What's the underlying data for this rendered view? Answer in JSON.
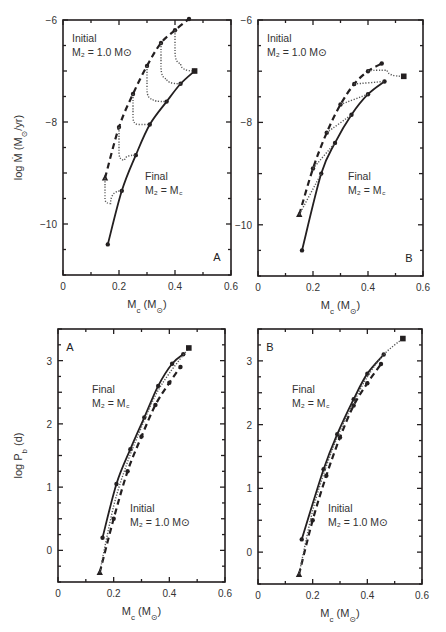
{
  "chart_data": [
    {
      "type": "line",
      "panel": "A",
      "position": "top-left",
      "xlabel": "M_c (M_⊙)",
      "ylabel": "log Ṁ (M_⊙/yr)",
      "xlim": [
        0,
        0.6
      ],
      "ylim": [
        -11,
        -6
      ],
      "xticks": [
        0,
        0.2,
        0.4,
        0.6
      ],
      "xtick_labels": [
        "0",
        "0.2",
        "0.4",
        "0.6"
      ],
      "yticks": [
        -10,
        -8,
        -6
      ],
      "ytick_labels": [
        "−10",
        "−8",
        "−6"
      ],
      "annotations": [
        {
          "text1": "Initial",
          "text2": "M₂ = 1.0 M⊙",
          "at": "top-left"
        },
        {
          "text1": "Final",
          "text2": "M₂ = M꜀",
          "at": "center-right"
        }
      ],
      "series": [
        {
          "name": "Final M2 = Mc",
          "style": "solid",
          "x": [
            0.16,
            0.21,
            0.26,
            0.31,
            0.37,
            0.42,
            0.47
          ],
          "y": [
            -10.4,
            -9.35,
            -8.65,
            -8.05,
            -7.6,
            -7.25,
            -7.0
          ]
        },
        {
          "name": "Initial M2 = 1.0 Msun",
          "style": "dashed",
          "x": [
            0.15,
            0.2,
            0.25,
            0.3,
            0.35,
            0.4,
            0.45
          ],
          "y": [
            -9.1,
            -8.1,
            -7.45,
            -6.9,
            -6.45,
            -6.2,
            -5.98
          ]
        },
        {
          "name": "track 1",
          "style": "dotted",
          "x": [
            0.15,
            0.15,
            0.17,
            0.21
          ],
          "y": [
            -9.1,
            -9.5,
            -9.6,
            -9.35
          ]
        },
        {
          "name": "track 2",
          "style": "dotted",
          "x": [
            0.2,
            0.2,
            0.22,
            0.26
          ],
          "y": [
            -8.1,
            -8.6,
            -8.75,
            -8.65
          ]
        },
        {
          "name": "track 3",
          "style": "dotted",
          "x": [
            0.25,
            0.25,
            0.27,
            0.31
          ],
          "y": [
            -7.45,
            -7.9,
            -8.05,
            -8.05
          ]
        },
        {
          "name": "track 4",
          "style": "dotted",
          "x": [
            0.3,
            0.3,
            0.32,
            0.37
          ],
          "y": [
            -6.9,
            -7.35,
            -7.55,
            -7.6
          ]
        },
        {
          "name": "track 5",
          "style": "dotted",
          "x": [
            0.35,
            0.35,
            0.37,
            0.42
          ],
          "y": [
            -6.45,
            -6.9,
            -7.15,
            -7.25
          ]
        },
        {
          "name": "track 6",
          "style": "dotted",
          "x": [
            0.4,
            0.4,
            0.42,
            0.47
          ],
          "y": [
            -6.2,
            -6.6,
            -6.85,
            -7.0
          ]
        }
      ],
      "end_marker": {
        "x": 0.47,
        "y": -7.0
      }
    },
    {
      "type": "line",
      "panel": "B",
      "position": "top-right",
      "xlabel": "M_c (M_⊙)",
      "xlim": [
        0,
        0.6
      ],
      "ylim": [
        -11,
        -6
      ],
      "xticks": [
        0,
        0.2,
        0.4,
        0.6
      ],
      "xtick_labels": [
        "0",
        "0.2",
        "0.4",
        "0.6"
      ],
      "yticks": [
        -10,
        -8,
        -6
      ],
      "ytick_labels": [
        "−10",
        "−8",
        "−6"
      ],
      "annotations": [
        {
          "text1": "Initial",
          "text2": "M₂ = 1.0 M⊙",
          "at": "top-left"
        },
        {
          "text1": "Final",
          "text2": "M₂ = M꜀",
          "at": "center-right"
        }
      ],
      "series": [
        {
          "name": "Final M2 = Mc",
          "style": "solid",
          "x": [
            0.16,
            0.23,
            0.28,
            0.34,
            0.4,
            0.46
          ],
          "y": [
            -10.5,
            -9.0,
            -8.4,
            -7.85,
            -7.45,
            -7.2
          ]
        },
        {
          "name": "Initial M2 = 1.0 Msun",
          "style": "dashed",
          "x": [
            0.15,
            0.2,
            0.25,
            0.3,
            0.35,
            0.4,
            0.45
          ],
          "y": [
            -9.8,
            -8.9,
            -8.2,
            -7.65,
            -7.25,
            -7.0,
            -6.85
          ]
        },
        {
          "name": "track 1",
          "style": "dotted",
          "x": [
            0.15,
            0.23
          ],
          "y": [
            -9.8,
            -9.0
          ]
        },
        {
          "name": "track 2",
          "style": "dotted",
          "x": [
            0.2,
            0.28
          ],
          "y": [
            -8.9,
            -8.4
          ]
        },
        {
          "name": "track 3",
          "style": "dotted",
          "x": [
            0.25,
            0.34
          ],
          "y": [
            -8.2,
            -7.85
          ]
        },
        {
          "name": "track 4",
          "style": "dotted",
          "x": [
            0.3,
            0.4
          ],
          "y": [
            -7.65,
            -7.45
          ]
        },
        {
          "name": "track 5",
          "style": "dotted",
          "x": [
            0.35,
            0.46
          ],
          "y": [
            -7.25,
            -7.2
          ]
        },
        {
          "name": "track 6",
          "style": "dotted",
          "x": [
            0.4,
            0.47,
            0.53
          ],
          "y": [
            -7.0,
            -6.98,
            -7.1
          ]
        }
      ],
      "end_marker": {
        "x": 0.53,
        "y": -7.1
      }
    },
    {
      "type": "line",
      "panel": "A",
      "position": "bottom-left",
      "xlabel": "M_c (M_⊙)",
      "ylabel": "log P_b (d)",
      "xlim": [
        0,
        0.6
      ],
      "ylim": [
        -0.5,
        3.5
      ],
      "xticks": [
        0,
        0.2,
        0.4,
        0.6
      ],
      "xtick_labels": [
        "0",
        "0.2",
        "0.4",
        "0.6"
      ],
      "yticks": [
        0,
        1,
        2,
        3
      ],
      "ytick_labels": [
        "0",
        "1",
        "2",
        "3"
      ],
      "annotations": [
        {
          "text1": "Final",
          "text2": "M₂ = M꜀",
          "at": "upper-middle"
        },
        {
          "text1": "Initial",
          "text2": "M₂ = 1.0 M⊙",
          "at": "lower-right"
        }
      ],
      "series": [
        {
          "name": "Final M2 = Mc",
          "style": "solid",
          "x": [
            0.16,
            0.21,
            0.26,
            0.31,
            0.36,
            0.41,
            0.45
          ],
          "y": [
            0.2,
            1.05,
            1.6,
            2.1,
            2.6,
            2.95,
            3.1
          ]
        },
        {
          "name": "Initial M2 = 1.0 Msun",
          "style": "dashed",
          "x": [
            0.15,
            0.2,
            0.25,
            0.3,
            0.35,
            0.4,
            0.44
          ],
          "y": [
            -0.35,
            0.5,
            1.25,
            1.8,
            2.3,
            2.65,
            2.9
          ]
        },
        {
          "name": "tracks",
          "style": "dotted",
          "x": [
            0.15,
            0.2,
            0.25,
            0.3,
            0.35,
            0.4,
            0.47
          ],
          "y": [
            -0.35,
            0.7,
            1.4,
            1.95,
            2.45,
            2.8,
            3.2
          ]
        }
      ],
      "end_marker": {
        "x": 0.47,
        "y": 3.2
      }
    },
    {
      "type": "line",
      "panel": "B",
      "position": "bottom-right",
      "xlabel": "M_c (M_⊙)",
      "xlim": [
        0,
        0.6
      ],
      "ylim": [
        -0.5,
        3.5
      ],
      "xticks": [
        0,
        0.2,
        0.4,
        0.6
      ],
      "xtick_labels": [
        "0",
        "0.2",
        "0.4",
        "0.6"
      ],
      "yticks": [
        0,
        1,
        2,
        3
      ],
      "ytick_labels": [
        "0",
        "1",
        "2",
        "3"
      ],
      "annotations": [
        {
          "text1": "Final",
          "text2": "M₂ = M꜀",
          "at": "upper-middle"
        },
        {
          "text1": "Initial",
          "text2": "M₂ = 1.0 M⊙",
          "at": "lower-right"
        }
      ],
      "series": [
        {
          "name": "Final M2 = Mc",
          "style": "solid",
          "x": [
            0.16,
            0.24,
            0.29,
            0.35,
            0.4,
            0.46
          ],
          "y": [
            0.2,
            1.3,
            1.85,
            2.4,
            2.8,
            3.1
          ]
        },
        {
          "name": "Initial M2 = 1.0 Msun",
          "style": "dashed",
          "x": [
            0.15,
            0.2,
            0.25,
            0.3,
            0.35,
            0.4,
            0.45
          ],
          "y": [
            -0.35,
            0.5,
            1.2,
            1.8,
            2.3,
            2.65,
            2.95
          ]
        },
        {
          "name": "tracks",
          "style": "dotted",
          "x": [
            0.15,
            0.2,
            0.25,
            0.3,
            0.35,
            0.4,
            0.46,
            0.53
          ],
          "y": [
            -0.35,
            0.65,
            1.35,
            1.9,
            2.35,
            2.75,
            3.1,
            3.35
          ]
        }
      ],
      "end_marker": {
        "x": 0.53,
        "y": 3.35
      }
    }
  ]
}
